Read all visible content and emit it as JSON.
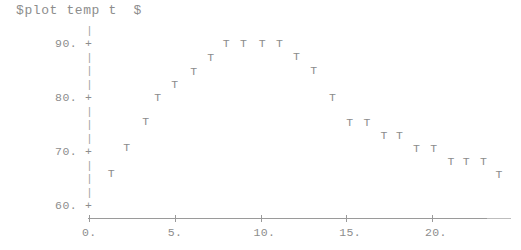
{
  "title": "$plot temp t  $",
  "colors": {
    "ink": "#8d8d8d",
    "axis": "#9a9a9a",
    "marker": "#8b8b8b",
    "background": "#ffffff"
  },
  "axes": {
    "y_ticks": [
      "90.",
      "80.",
      "70.",
      "60."
    ],
    "y_tick_values": [
      90,
      80,
      70,
      60
    ],
    "x_ticks": [
      "0.",
      "5.",
      "10.",
      "15.",
      "20."
    ],
    "x_tick_values": [
      0,
      5,
      10,
      15,
      20
    ],
    "y_stem_glyph": "|",
    "y_tick_glyph": "+",
    "marker_glyph": "T"
  },
  "chart_data": {
    "type": "scatter",
    "title": "$plot temp t  $",
    "xlabel": "t",
    "ylabel": "temp",
    "marker": "T",
    "grid": false,
    "legend": false,
    "xlim": [
      0,
      24
    ],
    "ylim": [
      60,
      92
    ],
    "x_tick_labels": [
      "0.",
      "5.",
      "10.",
      "15.",
      "20."
    ],
    "y_tick_labels": [
      "60.",
      "70.",
      "80.",
      "90."
    ],
    "series": [
      {
        "name": "temp",
        "points": [
          {
            "x": 1.3,
            "y": 65.7
          },
          {
            "x": 2.2,
            "y": 70.5
          },
          {
            "x": 3.3,
            "y": 75.3
          },
          {
            "x": 4.0,
            "y": 79.9
          },
          {
            "x": 5.0,
            "y": 82.2
          },
          {
            "x": 6.1,
            "y": 84.6
          },
          {
            "x": 7.1,
            "y": 87.2
          },
          {
            "x": 8.0,
            "y": 89.8
          },
          {
            "x": 9.0,
            "y": 89.8
          },
          {
            "x": 10.1,
            "y": 89.8
          },
          {
            "x": 11.1,
            "y": 89.8
          },
          {
            "x": 12.1,
            "y": 87.4
          },
          {
            "x": 13.1,
            "y": 84.9
          },
          {
            "x": 14.2,
            "y": 79.9
          },
          {
            "x": 15.2,
            "y": 75.2
          },
          {
            "x": 16.2,
            "y": 75.2
          },
          {
            "x": 17.2,
            "y": 72.8
          },
          {
            "x": 18.1,
            "y": 72.8
          },
          {
            "x": 19.1,
            "y": 70.4
          },
          {
            "x": 20.1,
            "y": 70.4
          },
          {
            "x": 21.1,
            "y": 67.9
          },
          {
            "x": 22.0,
            "y": 67.9
          },
          {
            "x": 23.0,
            "y": 67.9
          },
          {
            "x": 23.9,
            "y": 65.5
          }
        ]
      }
    ]
  }
}
